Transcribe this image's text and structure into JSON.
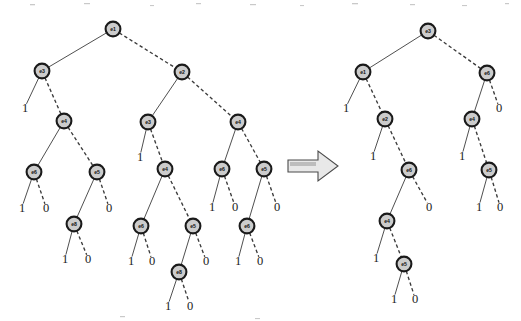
{
  "figure": {
    "colors": {
      "node_fill": "#cccccc",
      "node_stroke": "#1a1a1a",
      "edge": "#3b3b3b",
      "arrow_fill": "#e8e8e8",
      "arrow_stroke": "#4a4a4a",
      "background": "#ffffff"
    },
    "arrow": {
      "name": "transformation-arrow",
      "direction": "right"
    },
    "diagrams": [
      {
        "id": "left-diagram",
        "name": "original-bdd",
        "nodes": [
          {
            "id": "L1",
            "label": "e1",
            "x": 113,
            "y": 29
          },
          {
            "id": "L2",
            "label": "e3",
            "x": 42,
            "y": 71
          },
          {
            "id": "L3",
            "label": "e2",
            "x": 182,
            "y": 72
          },
          {
            "id": "L4",
            "label": "e4",
            "x": 64,
            "y": 121
          },
          {
            "id": "L5",
            "label": "e3",
            "x": 148,
            "y": 122
          },
          {
            "id": "L6",
            "label": "e4",
            "x": 238,
            "y": 122
          },
          {
            "id": "L7",
            "label": "e6",
            "x": 34,
            "y": 172
          },
          {
            "id": "L8",
            "label": "e5",
            "x": 97,
            "y": 172
          },
          {
            "id": "L9",
            "label": "e4",
            "x": 165,
            "y": 169
          },
          {
            "id": "L10",
            "label": "e6",
            "x": 222,
            "y": 169
          },
          {
            "id": "L11",
            "label": "e5",
            "x": 264,
            "y": 169
          },
          {
            "id": "L12",
            "label": "e8",
            "x": 74,
            "y": 224
          },
          {
            "id": "L13",
            "label": "e6",
            "x": 141,
            "y": 226
          },
          {
            "id": "L14",
            "label": "e5",
            "x": 193,
            "y": 226
          },
          {
            "id": "L15",
            "label": "e6",
            "x": 247,
            "y": 226
          },
          {
            "id": "L16",
            "label": "e8",
            "x": 179,
            "y": 272
          }
        ],
        "leaves": [
          {
            "id": "LA1",
            "label": "1",
            "x": 25,
            "y": 112
          },
          {
            "id": "LA2",
            "label": "1",
            "x": 140,
            "y": 161
          },
          {
            "id": "LA3",
            "label": "1",
            "x": 22,
            "y": 212
          },
          {
            "id": "LA4",
            "label": "0",
            "x": 46,
            "y": 212
          },
          {
            "id": "LA5",
            "label": "0",
            "x": 109,
            "y": 212
          },
          {
            "id": "LA6",
            "label": "1",
            "x": 212,
            "y": 211
          },
          {
            "id": "LA7",
            "label": "0",
            "x": 235,
            "y": 211
          },
          {
            "id": "LA8",
            "label": "0",
            "x": 277,
            "y": 211
          },
          {
            "id": "LA9",
            "label": "1",
            "x": 65,
            "y": 263
          },
          {
            "id": "LA10",
            "label": "0",
            "x": 88,
            "y": 263
          },
          {
            "id": "LA11",
            "label": "1",
            "x": 131,
            "y": 265
          },
          {
            "id": "LA12",
            "label": "0",
            "x": 152,
            "y": 265
          },
          {
            "id": "LA13",
            "label": "0",
            "x": 206,
            "y": 265
          },
          {
            "id": "LA14",
            "label": "1",
            "x": 238,
            "y": 265
          },
          {
            "id": "LA15",
            "label": "0",
            "x": 260,
            "y": 265
          },
          {
            "id": "LA16",
            "label": "1",
            "x": 168,
            "y": 310
          },
          {
            "id": "LA17",
            "label": "0",
            "x": 190,
            "y": 310
          }
        ],
        "edges": [
          {
            "from": "L1",
            "to": "L2",
            "style": "solid"
          },
          {
            "from": "L1",
            "to": "L3",
            "style": "dashed"
          },
          {
            "from": "L2",
            "to": "LA1",
            "style": "solid"
          },
          {
            "from": "L2",
            "to": "L4",
            "style": "dashed"
          },
          {
            "from": "L3",
            "to": "L5",
            "style": "solid"
          },
          {
            "from": "L3",
            "to": "L6",
            "style": "dashed"
          },
          {
            "from": "L4",
            "to": "L7",
            "style": "solid"
          },
          {
            "from": "L4",
            "to": "L8",
            "style": "dashed"
          },
          {
            "from": "L5",
            "to": "LA2",
            "style": "solid"
          },
          {
            "from": "L5",
            "to": "L9",
            "style": "dashed"
          },
          {
            "from": "L6",
            "to": "L10",
            "style": "solid"
          },
          {
            "from": "L6",
            "to": "L11",
            "style": "dashed"
          },
          {
            "from": "L7",
            "to": "LA3",
            "style": "solid"
          },
          {
            "from": "L7",
            "to": "LA4",
            "style": "dashed"
          },
          {
            "from": "L8",
            "to": "L12",
            "style": "solid"
          },
          {
            "from": "L8",
            "to": "LA5",
            "style": "dashed"
          },
          {
            "from": "L9",
            "to": "L13",
            "style": "solid"
          },
          {
            "from": "L9",
            "to": "L14",
            "style": "dashed"
          },
          {
            "from": "L10",
            "to": "LA6",
            "style": "solid"
          },
          {
            "from": "L10",
            "to": "LA7",
            "style": "dashed"
          },
          {
            "from": "L11",
            "to": "L15",
            "style": "solid"
          },
          {
            "from": "L11",
            "to": "LA8",
            "style": "dashed"
          },
          {
            "from": "L12",
            "to": "LA9",
            "style": "solid"
          },
          {
            "from": "L12",
            "to": "LA10",
            "style": "dashed"
          },
          {
            "from": "L13",
            "to": "LA11",
            "style": "solid"
          },
          {
            "from": "L13",
            "to": "LA12",
            "style": "dashed"
          },
          {
            "from": "L14",
            "to": "L16",
            "style": "solid"
          },
          {
            "from": "L14",
            "to": "LA13",
            "style": "dashed"
          },
          {
            "from": "L15",
            "to": "LA14",
            "style": "solid"
          },
          {
            "from": "L15",
            "to": "LA15",
            "style": "dashed"
          },
          {
            "from": "L16",
            "to": "LA16",
            "style": "solid"
          },
          {
            "from": "L16",
            "to": "LA17",
            "style": "dashed"
          }
        ]
      },
      {
        "id": "right-diagram",
        "name": "reduced-bdd",
        "nodes": [
          {
            "id": "R1",
            "label": "e3",
            "x": 428,
            "y": 31
          },
          {
            "id": "R2",
            "label": "e1",
            "x": 363,
            "y": 72
          },
          {
            "id": "R3",
            "label": "e6",
            "x": 487,
            "y": 73
          },
          {
            "id": "R4",
            "label": "e2",
            "x": 385,
            "y": 119
          },
          {
            "id": "R5",
            "label": "e4",
            "x": 472,
            "y": 119
          },
          {
            "id": "R6",
            "label": "e6",
            "x": 409,
            "y": 170
          },
          {
            "id": "R7",
            "label": "e5",
            "x": 489,
            "y": 170
          },
          {
            "id": "R8",
            "label": "e4",
            "x": 387,
            "y": 221
          },
          {
            "id": "R9",
            "label": "e5",
            "x": 404,
            "y": 264
          }
        ],
        "leaves": [
          {
            "id": "RA1",
            "label": "1",
            "x": 346,
            "y": 112
          },
          {
            "id": "RA2",
            "label": "0",
            "x": 499,
            "y": 112
          },
          {
            "id": "RA3",
            "label": "1",
            "x": 373,
            "y": 160
          },
          {
            "id": "RA4",
            "label": "1",
            "x": 462,
            "y": 160
          },
          {
            "id": "RA5",
            "label": "0",
            "x": 429,
            "y": 211
          },
          {
            "id": "RA6",
            "label": "1",
            "x": 479,
            "y": 211
          },
          {
            "id": "RA7",
            "label": "0",
            "x": 500,
            "y": 211
          },
          {
            "id": "RA8",
            "label": "1",
            "x": 376,
            "y": 262
          },
          {
            "id": "RA9",
            "label": "1",
            "x": 394,
            "y": 303
          },
          {
            "id": "RA10",
            "label": "0",
            "x": 415,
            "y": 303
          }
        ],
        "edges": [
          {
            "from": "R1",
            "to": "R2",
            "style": "solid"
          },
          {
            "from": "R1",
            "to": "R3",
            "style": "dashed"
          },
          {
            "from": "R2",
            "to": "RA1",
            "style": "solid"
          },
          {
            "from": "R2",
            "to": "R4",
            "style": "dashed"
          },
          {
            "from": "R3",
            "to": "R5",
            "style": "solid"
          },
          {
            "from": "R3",
            "to": "RA2",
            "style": "dashed"
          },
          {
            "from": "R4",
            "to": "RA3",
            "style": "solid"
          },
          {
            "from": "R4",
            "to": "R6",
            "style": "dashed"
          },
          {
            "from": "R5",
            "to": "RA4",
            "style": "solid"
          },
          {
            "from": "R5",
            "to": "R7",
            "style": "dashed"
          },
          {
            "from": "R6",
            "to": "R8",
            "style": "solid"
          },
          {
            "from": "R6",
            "to": "RA5",
            "style": "dashed"
          },
          {
            "from": "R7",
            "to": "RA6",
            "style": "solid"
          },
          {
            "from": "R7",
            "to": "RA7",
            "style": "dashed"
          },
          {
            "from": "R8",
            "to": "RA8",
            "style": "solid"
          },
          {
            "from": "R8",
            "to": "R9",
            "style": "dashed"
          },
          {
            "from": "R9",
            "to": "RA9",
            "style": "solid"
          },
          {
            "from": "R9",
            "to": "RA10",
            "style": "dashed"
          }
        ]
      }
    ]
  }
}
